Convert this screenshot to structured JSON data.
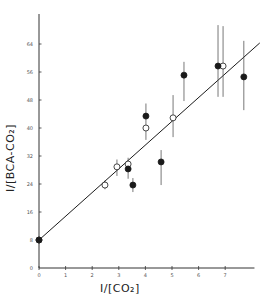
{
  "chart_data": {
    "type": "scatter",
    "title": "",
    "xlabel": "1/[CO2]",
    "ylabel": "1/[BCA-CO2]",
    "xlim": [
      0,
      8.1
    ],
    "ylim": [
      0,
      70
    ],
    "x_ticks": [
      0,
      1,
      2,
      3,
      4,
      5,
      6,
      7
    ],
    "y_ticks": [
      0,
      8,
      16,
      24,
      32,
      40,
      48,
      56,
      64
    ],
    "grid": false,
    "legend": null,
    "fit_line": {
      "x0": 0,
      "y0": 8,
      "x1": 8.3,
      "y1": 64.3
    },
    "series": [
      {
        "name": "open circles",
        "marker": "open",
        "points": [
          {
            "x": 0,
            "y": 8,
            "err_lo": 8,
            "err_hi": 8
          },
          {
            "x": 2.48,
            "y": 23.7,
            "err_lo": 22.5,
            "err_hi": 25
          },
          {
            "x": 2.93,
            "y": 28.9,
            "err_lo": 26.3,
            "err_hi": 31
          },
          {
            "x": 3.35,
            "y": 29.7,
            "err_lo": 28.5,
            "err_hi": 31.5
          },
          {
            "x": 4.02,
            "y": 40,
            "err_lo": 36.6,
            "err_hi": 41
          },
          {
            "x": 5.04,
            "y": 42.9,
            "err_lo": 37.4,
            "err_hi": 49.4
          },
          {
            "x": 6.92,
            "y": 57.7,
            "err_lo": 48.9,
            "err_hi": 69.1
          }
        ]
      },
      {
        "name": "filled circles",
        "marker": "filled",
        "points": [
          {
            "x": 0,
            "y": 8,
            "err_lo": 8,
            "err_hi": 8
          },
          {
            "x": 3.35,
            "y": 28.3,
            "err_lo": 25.5,
            "err_hi": 29.5
          },
          {
            "x": 3.53,
            "y": 23.7,
            "err_lo": 21.7,
            "err_hi": 25.7
          },
          {
            "x": 4.02,
            "y": 43.4,
            "err_lo": 41,
            "err_hi": 47
          },
          {
            "x": 4.59,
            "y": 30.3,
            "err_lo": 23.7,
            "err_hi": 33.7
          },
          {
            "x": 5.45,
            "y": 55.1,
            "err_lo": 47.7,
            "err_hi": 58.9
          },
          {
            "x": 6.73,
            "y": 57.7,
            "err_lo": 48.9,
            "err_hi": 69.4
          },
          {
            "x": 7.7,
            "y": 54.6,
            "err_lo": 45.1,
            "err_hi": 64.9
          }
        ]
      }
    ]
  },
  "labels": {
    "x_axis_title": "I/[CO₂]",
    "y_axis_title": "I/[BCA-CO₂]"
  },
  "style": {
    "ink": "#1a1a1a",
    "axis": "#333333",
    "background": "#ffffff"
  }
}
